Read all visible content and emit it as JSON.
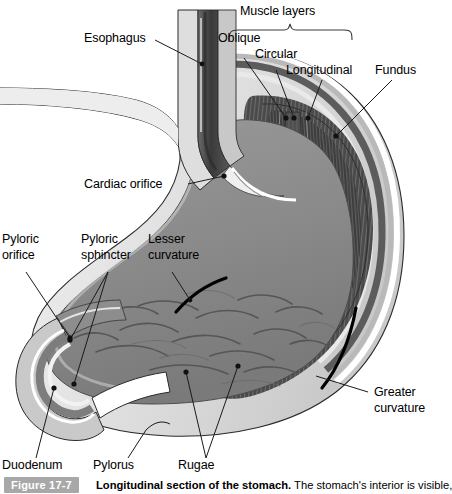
{
  "figure": {
    "number_label": "Figure 17-7",
    "title": "Longitudinal section of the stomach.",
    "caption_rest": " The stomach's interior is visible,",
    "badge_color": "#a8a8a8",
    "background_color": "#ffffff",
    "line_color": "#1a1a1a"
  },
  "bracket": {
    "label": "Muscle layers"
  },
  "labels": {
    "esophagus": "Esophagus",
    "oblique": "Oblique",
    "circular": "Circular",
    "longitudinal": "Longitudinal",
    "fundus": "Fundus",
    "cardiac_orifice": "Cardiac orifice",
    "pyloric_orifice_l1": "Pyloric",
    "pyloric_orifice_l2": "orifice",
    "pyloric_sphincter_l1": "Pyloric",
    "pyloric_sphincter_l2": "sphincter",
    "lesser_curvature_l1": "Lesser",
    "lesser_curvature_l2": "curvature",
    "greater_curvature_l1": "Greater",
    "greater_curvature_l2": "curvature",
    "duodenum": "Duodenum",
    "pylorus": "Pylorus",
    "rugae": "Rugae"
  },
  "anatomy_colors": {
    "serosa_outer": "#cfcfcf",
    "muscle_dark": "#4a4a4a",
    "muscle_mid": "#6e6e6e",
    "submucosa_light": "#e8e8e8",
    "mucosa_gray": "#8a8a8a",
    "lumen_pale": "#dcdcdc",
    "esophagus_dark": "#3f3f3f",
    "rugae_line": "#5a5a5a",
    "highlight_white": "#f7f7f7",
    "curvature_marker": "#000000"
  }
}
